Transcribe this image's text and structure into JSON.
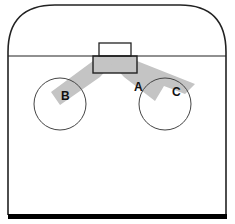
{
  "diagram": {
    "type": "hockey-rink-zone",
    "colors": {
      "line": "#222222",
      "circle": "#444444",
      "shaded": "#c4c4c4",
      "bottom_bar": "#000000",
      "background": "#ffffff"
    },
    "labels": {
      "a": "A",
      "b": "B",
      "c": "C"
    }
  }
}
